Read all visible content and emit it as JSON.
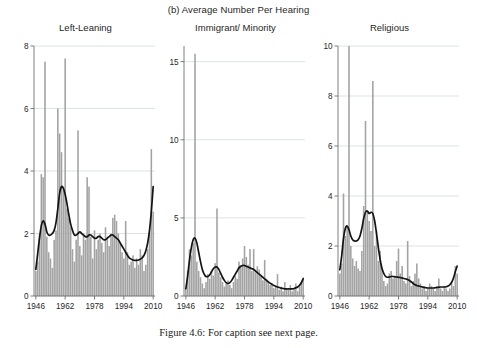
{
  "figure": {
    "supertitle": "(b) Average Number Per Hearing",
    "caption": "Figure 4.6:  For caption see next page."
  },
  "colors": {
    "bar": "#a3a3a3",
    "smooth": "#141414",
    "grid": "#cfd6de",
    "axis": "#6f6f6f",
    "background": "#ffffff"
  },
  "chart_data": [
    {
      "type": "bar",
      "title": "Left-Leaning",
      "xlabel": "",
      "ylabel": "",
      "xlim": [
        1945,
        2011
      ],
      "ylim": [
        0,
        8
      ],
      "yticks": [
        0,
        2,
        4,
        6,
        8
      ],
      "ytick_labels": [
        "0",
        "2",
        "4",
        "6",
        "8"
      ],
      "xticks": [
        1946,
        1962,
        1978,
        1994,
        2010
      ],
      "xtick_labels": [
        "1946",
        "1962",
        "1978",
        "1994",
        "2010"
      ],
      "grid": true,
      "legend": "none",
      "x": [
        1946,
        1947,
        1948,
        1949,
        1950,
        1951,
        1952,
        1953,
        1954,
        1955,
        1956,
        1957,
        1958,
        1959,
        1960,
        1961,
        1962,
        1963,
        1964,
        1965,
        1966,
        1967,
        1968,
        1969,
        1970,
        1971,
        1972,
        1973,
        1974,
        1975,
        1976,
        1977,
        1978,
        1979,
        1980,
        1981,
        1982,
        1983,
        1984,
        1985,
        1986,
        1987,
        1988,
        1989,
        1990,
        1991,
        1992,
        1993,
        1994,
        1995,
        1996,
        1997,
        1998,
        1999,
        2000,
        2001,
        2002,
        2003,
        2004,
        2005,
        2006,
        2007,
        2008,
        2009,
        2010
      ],
      "values": [
        0.8,
        1.1,
        2.0,
        3.9,
        3.8,
        7.5,
        1.9,
        1.4,
        1.2,
        0.9,
        1.8,
        2.1,
        6.0,
        5.2,
        4.6,
        3.4,
        7.6,
        2.8,
        2.5,
        2.2,
        1.5,
        1.1,
        1.8,
        5.3,
        1.6,
        1.3,
        2.0,
        1.8,
        3.8,
        3.5,
        1.9,
        1.2,
        2.1,
        1.5,
        1.8,
        2.0,
        1.7,
        1.4,
        2.2,
        1.9,
        1.6,
        2.0,
        2.5,
        2.6,
        2.4,
        2.0,
        1.7,
        1.4,
        1.2,
        2.4,
        1.4,
        1.0,
        1.1,
        1.3,
        0.9,
        1.2,
        1.0,
        1.5,
        1.3,
        0.8,
        1.0,
        1.5,
        2.0,
        4.7,
        2.7
      ],
      "smooth_x": [
        1946,
        1947,
        1948,
        1949,
        1950,
        1951,
        1952,
        1953,
        1954,
        1955,
        1956,
        1957,
        1958,
        1959,
        1960,
        1961,
        1962,
        1963,
        1964,
        1965,
        1966,
        1967,
        1968,
        1969,
        1970,
        1971,
        1972,
        1973,
        1974,
        1975,
        1976,
        1977,
        1978,
        1979,
        1980,
        1981,
        1982,
        1983,
        1984,
        1985,
        1986,
        1987,
        1988,
        1989,
        1990,
        1991,
        1992,
        1993,
        1994,
        1995,
        1996,
        1997,
        1998,
        1999,
        2000,
        2001,
        2002,
        2003,
        2004,
        2005,
        2006,
        2007,
        2008,
        2009,
        2010
      ],
      "smooth_values": [
        0.85,
        1.35,
        1.85,
        2.25,
        2.4,
        2.3,
        2.05,
        1.95,
        1.95,
        2.0,
        2.1,
        2.35,
        2.8,
        3.3,
        3.5,
        3.45,
        3.25,
        2.95,
        2.6,
        2.3,
        2.1,
        1.95,
        1.95,
        2.0,
        2.05,
        2.0,
        1.95,
        1.9,
        1.9,
        1.95,
        1.95,
        1.9,
        1.85,
        1.85,
        1.9,
        1.9,
        1.85,
        1.8,
        1.8,
        1.85,
        1.9,
        1.95,
        1.95,
        1.9,
        1.85,
        1.8,
        1.7,
        1.6,
        1.5,
        1.4,
        1.3,
        1.22,
        1.18,
        1.15,
        1.14,
        1.14,
        1.15,
        1.18,
        1.22,
        1.3,
        1.45,
        1.7,
        2.1,
        2.7,
        3.5
      ]
    },
    {
      "type": "bar",
      "title": "Immigrant/ Minority",
      "xlabel": "",
      "ylabel": "",
      "xlim": [
        1945,
        2011
      ],
      "ylim": [
        0,
        16
      ],
      "yticks": [
        0,
        5,
        10,
        15
      ],
      "ytick_labels": [
        "0",
        "5",
        "10",
        "15"
      ],
      "xticks": [
        1946,
        1962,
        1978,
        1994,
        2010
      ],
      "xtick_labels": [
        "1946",
        "1962",
        "1978",
        "1994",
        "2010"
      ],
      "grid": true,
      "legend": "none",
      "x": [
        1946,
        1947,
        1948,
        1949,
        1950,
        1951,
        1952,
        1953,
        1954,
        1955,
        1956,
        1957,
        1958,
        1959,
        1960,
        1961,
        1962,
        1963,
        1964,
        1965,
        1966,
        1967,
        1968,
        1969,
        1970,
        1971,
        1972,
        1973,
        1974,
        1975,
        1976,
        1977,
        1978,
        1979,
        1980,
        1981,
        1982,
        1983,
        1984,
        1985,
        1986,
        1987,
        1988,
        1989,
        1990,
        1991,
        1992,
        1993,
        1994,
        1995,
        1996,
        1997,
        1998,
        1999,
        2000,
        2001,
        2002,
        2003,
        2004,
        2005,
        2006,
        2007,
        2008,
        2009,
        2010
      ],
      "values": [
        0.4,
        1.6,
        3.0,
        2.6,
        3.4,
        15.5,
        2.2,
        1.6,
        1.2,
        0.8,
        0.5,
        0.9,
        1.4,
        1.1,
        1.6,
        1.3,
        2.1,
        5.6,
        1.5,
        1.2,
        0.9,
        0.6,
        0.8,
        1.0,
        0.7,
        0.5,
        0.9,
        1.3,
        1.1,
        2.2,
        1.9,
        2.4,
        3.2,
        2.5,
        2.0,
        3.0,
        1.6,
        3.0,
        1.5,
        1.9,
        1.7,
        1.3,
        1.0,
        2.3,
        1.1,
        0.9,
        0.7,
        0.8,
        0.5,
        0.6,
        1.4,
        0.4,
        0.6,
        0.3,
        0.9,
        0.5,
        0.4,
        0.7,
        0.3,
        0.5,
        0.8,
        0.3,
        0.6,
        0.9,
        1.2
      ],
      "smooth_x": [
        1946,
        1947,
        1948,
        1949,
        1950,
        1951,
        1952,
        1953,
        1954,
        1955,
        1956,
        1957,
        1958,
        1959,
        1960,
        1961,
        1962,
        1963,
        1964,
        1965,
        1966,
        1967,
        1968,
        1969,
        1970,
        1971,
        1972,
        1973,
        1974,
        1975,
        1976,
        1977,
        1978,
        1979,
        1980,
        1981,
        1982,
        1983,
        1984,
        1985,
        1986,
        1987,
        1988,
        1989,
        1990,
        1991,
        1992,
        1993,
        1994,
        1995,
        1996,
        1997,
        1998,
        1999,
        2000,
        2001,
        2002,
        2003,
        2004,
        2005,
        2006,
        2007,
        2008,
        2009,
        2010
      ],
      "smooth_values": [
        0.45,
        1.3,
        2.3,
        3.1,
        3.6,
        3.7,
        3.4,
        2.8,
        2.2,
        1.7,
        1.4,
        1.25,
        1.25,
        1.35,
        1.55,
        1.75,
        1.85,
        1.85,
        1.7,
        1.45,
        1.2,
        1.0,
        0.85,
        0.8,
        0.85,
        1.0,
        1.2,
        1.4,
        1.6,
        1.8,
        1.9,
        1.95,
        1.95,
        1.9,
        1.85,
        1.8,
        1.75,
        1.7,
        1.6,
        1.5,
        1.4,
        1.3,
        1.2,
        1.1,
        1.0,
        0.9,
        0.82,
        0.75,
        0.68,
        0.62,
        0.58,
        0.54,
        0.5,
        0.48,
        0.46,
        0.45,
        0.45,
        0.45,
        0.46,
        0.48,
        0.52,
        0.58,
        0.68,
        0.85,
        1.1
      ]
    },
    {
      "type": "bar",
      "title": "Religious",
      "xlabel": "",
      "ylabel": "",
      "xlim": [
        1945,
        2011
      ],
      "ylim": [
        0,
        10
      ],
      "yticks": [
        0,
        2,
        4,
        6,
        8,
        10
      ],
      "ytick_labels": [
        "0",
        "2",
        "4",
        "6",
        "8",
        "10"
      ],
      "xticks": [
        1946,
        1962,
        1978,
        1994,
        2010
      ],
      "xtick_labels": [
        "1946",
        "1962",
        "1978",
        "1994",
        "2010"
      ],
      "grid": true,
      "legend": "none",
      "x": [
        1946,
        1947,
        1948,
        1949,
        1950,
        1951,
        1952,
        1953,
        1954,
        1955,
        1956,
        1957,
        1958,
        1959,
        1960,
        1961,
        1962,
        1963,
        1964,
        1965,
        1966,
        1967,
        1968,
        1969,
        1970,
        1971,
        1972,
        1973,
        1974,
        1975,
        1976,
        1977,
        1978,
        1979,
        1980,
        1981,
        1982,
        1983,
        1984,
        1985,
        1986,
        1987,
        1988,
        1989,
        1990,
        1991,
        1992,
        1993,
        1994,
        1995,
        1996,
        1997,
        1998,
        1999,
        2000,
        2001,
        2002,
        2003,
        2004,
        2005,
        2006,
        2007,
        2008,
        2009,
        2010
      ],
      "values": [
        0.9,
        1.3,
        4.1,
        2.4,
        2.8,
        10.0,
        2.0,
        1.5,
        1.2,
        1.4,
        1.1,
        1.0,
        1.8,
        3.6,
        7.0,
        3.4,
        3.0,
        2.6,
        8.6,
        2.0,
        2.6,
        1.4,
        1.8,
        1.1,
        0.6,
        0.4,
        0.5,
        0.9,
        1.0,
        0.7,
        0.8,
        1.4,
        1.9,
        0.9,
        1.2,
        0.6,
        0.5,
        2.2,
        0.8,
        0.4,
        0.6,
        0.9,
        1.3,
        0.7,
        0.5,
        0.3,
        0.4,
        0.2,
        0.3,
        0.5,
        0.4,
        0.3,
        0.2,
        0.4,
        0.7,
        0.3,
        0.2,
        0.4,
        0.3,
        0.2,
        0.3,
        0.5,
        0.4,
        1.2,
        0.9
      ],
      "smooth_x": [
        1946,
        1947,
        1948,
        1949,
        1950,
        1951,
        1952,
        1953,
        1954,
        1955,
        1956,
        1957,
        1958,
        1959,
        1960,
        1961,
        1962,
        1963,
        1964,
        1965,
        1966,
        1967,
        1968,
        1969,
        1970,
        1971,
        1972,
        1973,
        1974,
        1975,
        1976,
        1977,
        1978,
        1979,
        1980,
        1981,
        1982,
        1983,
        1984,
        1985,
        1986,
        1987,
        1988,
        1989,
        1990,
        1991,
        1992,
        1993,
        1994,
        1995,
        1996,
        1997,
        1998,
        1999,
        2000,
        2001,
        2002,
        2003,
        2004,
        2005,
        2006,
        2007,
        2008,
        2009,
        2010
      ],
      "smooth_values": [
        1.05,
        1.6,
        2.3,
        2.7,
        2.8,
        2.65,
        2.4,
        2.25,
        2.2,
        2.2,
        2.25,
        2.4,
        2.7,
        3.1,
        3.35,
        3.4,
        3.3,
        3.35,
        3.3,
        3.0,
        2.5,
        1.95,
        1.45,
        1.1,
        0.9,
        0.78,
        0.75,
        0.76,
        0.78,
        0.78,
        0.77,
        0.76,
        0.75,
        0.74,
        0.72,
        0.7,
        0.68,
        0.66,
        0.62,
        0.56,
        0.5,
        0.45,
        0.42,
        0.4,
        0.38,
        0.36,
        0.34,
        0.33,
        0.32,
        0.32,
        0.32,
        0.32,
        0.33,
        0.34,
        0.35,
        0.36,
        0.36,
        0.36,
        0.37,
        0.4,
        0.45,
        0.55,
        0.72,
        0.98,
        1.2
      ]
    }
  ]
}
